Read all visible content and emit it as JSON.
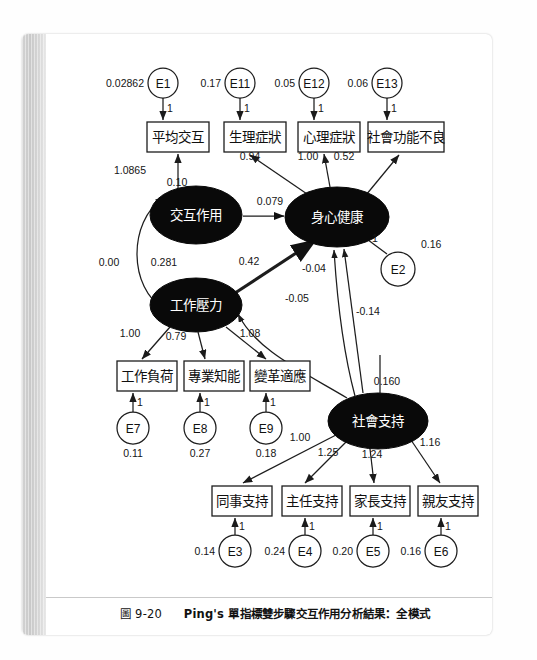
{
  "page": {
    "caption_number": "圖 9-20",
    "caption_title": "Ping's 單指標雙步驟交互作用分析結果：全模式"
  },
  "chart_data": {
    "type": "diagram",
    "diagram_kind": "structural-equation-model-path-diagram",
    "title": "Ping's 單指標雙步驟交互作用分析結果：全模式",
    "latent_variables": [
      {
        "id": "IA",
        "label": "交互作用",
        "x": 196,
        "y": 215,
        "rx": 46,
        "ry": 29
      },
      {
        "id": "JS",
        "label": "工作壓力",
        "x": 196,
        "y": 305,
        "rx": 46,
        "ry": 27
      },
      {
        "id": "PH",
        "label": "身心健康",
        "x": 337,
        "y": 217,
        "rx": 52,
        "ry": 30
      },
      {
        "id": "SS",
        "label": "社會支持",
        "x": 378,
        "y": 421,
        "rx": 50,
        "ry": 28
      }
    ],
    "observed_variables": [
      {
        "id": "AVI",
        "label": "平均交互",
        "x": 147,
        "y": 122,
        "w": 62,
        "h": 30
      },
      {
        "id": "PHY",
        "label": "生理症狀",
        "x": 224,
        "y": 122,
        "w": 62,
        "h": 30
      },
      {
        "id": "PSY",
        "label": "心理症狀",
        "x": 298,
        "y": 122,
        "w": 62,
        "h": 30
      },
      {
        "id": "SOC",
        "label": "社會功能不良",
        "x": 368,
        "y": 122,
        "w": 76,
        "h": 30
      },
      {
        "id": "WL",
        "label": "工作負荷",
        "x": 117,
        "y": 361,
        "w": 60,
        "h": 30
      },
      {
        "id": "PK",
        "label": "專業知能",
        "x": 184,
        "y": 361,
        "w": 60,
        "h": 30
      },
      {
        "id": "CA",
        "label": "變革適應",
        "x": 250,
        "y": 361,
        "w": 60,
        "h": 30
      },
      {
        "id": "CS",
        "label": "同事支持",
        "x": 212,
        "y": 486,
        "w": 60,
        "h": 30
      },
      {
        "id": "DS",
        "label": "主任支持",
        "x": 282,
        "y": 486,
        "w": 60,
        "h": 30
      },
      {
        "id": "PS",
        "label": "家長支持",
        "x": 350,
        "y": 486,
        "w": 60,
        "h": 30
      },
      {
        "id": "FS",
        "label": "親友支持",
        "x": 418,
        "y": 486,
        "w": 60,
        "h": 30
      }
    ],
    "error_terms": [
      {
        "id": "E1",
        "label": "E1",
        "x": 163,
        "y": 83,
        "r": 15,
        "variance": "0.02862",
        "var_side": "left"
      },
      {
        "id": "E11",
        "label": "E11",
        "x": 240,
        "y": 83,
        "r": 15,
        "variance": "0.17",
        "var_side": "left"
      },
      {
        "id": "E12",
        "label": "E12",
        "x": 314,
        "y": 83,
        "r": 15,
        "variance": "0.05",
        "var_side": "left"
      },
      {
        "id": "E13",
        "label": "E13",
        "x": 387,
        "y": 83,
        "r": 15,
        "variance": "0.06",
        "var_side": "left"
      },
      {
        "id": "E2",
        "label": "E2",
        "x": 398,
        "y": 269,
        "r": 17,
        "variance": "0.16",
        "var_side": "topright"
      },
      {
        "id": "E7",
        "label": "E7",
        "x": 133,
        "y": 428,
        "r": 16,
        "variance": "0.11",
        "var_side": "below"
      },
      {
        "id": "E8",
        "label": "E8",
        "x": 200,
        "y": 428,
        "r": 16,
        "variance": "0.27",
        "var_side": "below"
      },
      {
        "id": "E9",
        "label": "E9",
        "x": 266,
        "y": 428,
        "r": 16,
        "variance": "0.18",
        "var_side": "below"
      },
      {
        "id": "E3",
        "label": "E3",
        "x": 235,
        "y": 551,
        "r": 16,
        "variance": "0.14",
        "var_side": "left"
      },
      {
        "id": "E4",
        "label": "E4",
        "x": 305,
        "y": 551,
        "r": 16,
        "variance": "0.24",
        "var_side": "left"
      },
      {
        "id": "E5",
        "label": "E5",
        "x": 373,
        "y": 551,
        "r": 16,
        "variance": "0.20",
        "var_side": "left"
      },
      {
        "id": "E6",
        "label": "E6",
        "x": 441,
        "y": 551,
        "r": 16,
        "variance": "0.16",
        "var_side": "left"
      }
    ],
    "paths": [
      {
        "from": "E1",
        "to": "AVI",
        "coefficient": "1"
      },
      {
        "from": "E11",
        "to": "PHY",
        "coefficient": "1"
      },
      {
        "from": "E12",
        "to": "PSY",
        "coefficient": "1"
      },
      {
        "from": "E13",
        "to": "SOC",
        "coefficient": "1"
      },
      {
        "from": "E2",
        "to": "PH",
        "coefficient": "1"
      },
      {
        "from": "E7",
        "to": "WL",
        "coefficient": "1"
      },
      {
        "from": "E8",
        "to": "PK",
        "coefficient": "1"
      },
      {
        "from": "E9",
        "to": "CA",
        "coefficient": "1"
      },
      {
        "from": "E3",
        "to": "CS",
        "coefficient": "1"
      },
      {
        "from": "E4",
        "to": "DS",
        "coefficient": "1"
      },
      {
        "from": "E5",
        "to": "PS",
        "coefficient": "1"
      },
      {
        "from": "E6",
        "to": "FS",
        "coefficient": "1"
      },
      {
        "from": "IA",
        "to": "AVI",
        "coefficient": "1.0865"
      },
      {
        "from": "IA",
        "to": "AVI",
        "coefficient": "0.10",
        "note": "second label on loading path"
      },
      {
        "from": "IA",
        "to": "PH",
        "coefficient": "0.079"
      },
      {
        "from": "PH",
        "to": "PHY",
        "coefficient": "0.94"
      },
      {
        "from": "PH",
        "to": "PSY",
        "coefficient": "1.00"
      },
      {
        "from": "PH",
        "to": "SOC",
        "coefficient": "0.52"
      },
      {
        "from": "JS",
        "to": "PH",
        "coefficient": "0.42"
      },
      {
        "from": "JS",
        "to": "WL",
        "coefficient": "1.00"
      },
      {
        "from": "JS",
        "to": "PK",
        "coefficient": "0.79"
      },
      {
        "from": "JS",
        "to": "CA",
        "coefficient": "1.08"
      },
      {
        "from": "SS",
        "to": "PH",
        "coefficient": "-0.04"
      },
      {
        "from": "SS",
        "to": "JS",
        "coefficient": "-0.05"
      },
      {
        "from": "SS",
        "to": "PH",
        "coefficient": "-0.14",
        "note": "straight vertical path"
      },
      {
        "from": "SS",
        "to": "CS",
        "coefficient": "1.00"
      },
      {
        "from": "SS",
        "to": "DS",
        "coefficient": "1.25"
      },
      {
        "from": "SS",
        "to": "PS",
        "coefficient": "1.24"
      },
      {
        "from": "SS",
        "to": "FS",
        "coefficient": "1.16"
      },
      {
        "from": "SS",
        "to": "SS",
        "coefficient": "0.160",
        "note": "variance of 社會支持"
      }
    ],
    "covariances": [
      {
        "between": [
          "IA",
          "JS"
        ],
        "coefficient": "0.00",
        "double_headed": true
      },
      {
        "label_near_JS": "0.281",
        "note": "variance of 工作壓力"
      }
    ],
    "standalone_labels": [
      {
        "text": "0.00",
        "x": 109,
        "y": 266
      },
      {
        "text": "0.281",
        "x": 164,
        "y": 266
      },
      {
        "text": "0.42",
        "x": 249,
        "y": 265
      },
      {
        "text": "-0.04",
        "x": 314,
        "y": 272
      },
      {
        "text": "-0.05",
        "x": 297,
        "y": 302
      },
      {
        "text": "-0.14",
        "x": 368,
        "y": 315
      },
      {
        "text": "0.160",
        "x": 387,
        "y": 385
      },
      {
        "text": "0.079",
        "x": 270,
        "y": 205
      },
      {
        "text": "1.0865",
        "x": 130,
        "y": 174
      },
      {
        "text": "0.10",
        "x": 177,
        "y": 186
      },
      {
        "text": "0.94",
        "x": 250,
        "y": 160
      },
      {
        "text": "1.00",
        "x": 308,
        "y": 160
      },
      {
        "text": "0.52",
        "x": 344,
        "y": 160
      },
      {
        "text": "1.00",
        "x": 130,
        "y": 337
      },
      {
        "text": "0.79",
        "x": 176,
        "y": 340
      },
      {
        "text": "1.08",
        "x": 250,
        "y": 337
      },
      {
        "text": "1.00",
        "x": 300,
        "y": 441
      },
      {
        "text": "1.25",
        "x": 328,
        "y": 456
      },
      {
        "text": "1.24",
        "x": 372,
        "y": 458
      },
      {
        "text": "1.16",
        "x": 430,
        "y": 446
      },
      {
        "text": "1",
        "x": 375,
        "y": 242
      }
    ]
  }
}
